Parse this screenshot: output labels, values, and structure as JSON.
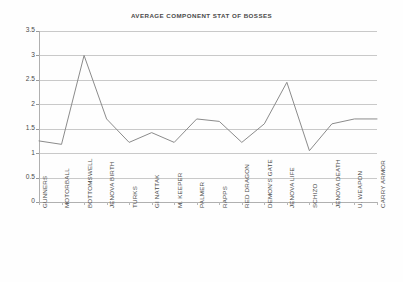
{
  "chart_data": {
    "type": "line",
    "title": "AVERAGE COMPONENT STAT OF BOSSES",
    "xlabel": "",
    "ylabel": "",
    "ylim": [
      0,
      3.5
    ],
    "grid": true,
    "legend": "none",
    "y_ticks": [
      "0",
      "0.5",
      "1",
      "1.5",
      "2",
      "2.5",
      "3",
      "3.5"
    ],
    "y_tick_values": [
      0,
      0.5,
      1,
      1.5,
      2,
      2.5,
      3,
      3.5
    ],
    "categories": [
      "GUNNERS",
      "MOTORBALL",
      "BOTTOMSWELL",
      "JENOVA BIRTH",
      "TURKS",
      "GI NATTAK",
      "M. KEEPER",
      "PALMER",
      "RAPPS",
      "RED DRAGON",
      "DEMON'S GATE",
      "JENOVA LIFE",
      "SCHIZO",
      "JENOVA DEATH",
      "U. WEAPON",
      "CARRY ARMOR"
    ],
    "values": [
      1.25,
      1.18,
      3.0,
      1.7,
      1.22,
      1.42,
      1.22,
      1.7,
      1.65,
      1.22,
      1.6,
      2.45,
      1.05,
      1.6,
      1.7,
      1.7
    ],
    "series": [
      {
        "name": "Average Component Stat",
        "color": "#8b8b8b",
        "values": [
          1.25,
          1.18,
          3.0,
          1.7,
          1.22,
          1.42,
          1.22,
          1.7,
          1.65,
          1.22,
          1.6,
          2.45,
          1.05,
          1.6,
          1.7,
          1.7
        ]
      }
    ],
    "colors": {
      "line": "#8b8b8b",
      "grid": "#c9c9c9",
      "axis": "#b0b0b0",
      "text": "#4a4a4a",
      "background": "#ffffff"
    }
  }
}
